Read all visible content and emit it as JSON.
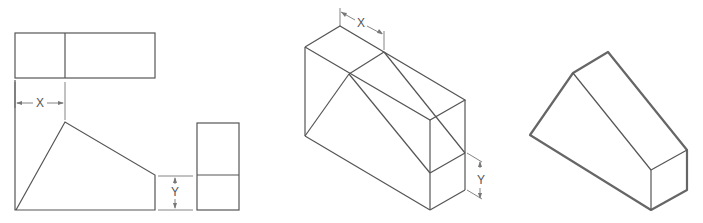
{
  "diagram": {
    "type": "engineering-drawing",
    "views": [
      {
        "id": "orthographic",
        "labels": {
          "x_dimension": "X",
          "y_dimension": "Y"
        }
      },
      {
        "id": "isometric-construction",
        "labels": {
          "x_dimension": "X",
          "y_dimension": "Y"
        }
      },
      {
        "id": "isometric-finished",
        "labels": {}
      }
    ],
    "colors": {
      "line": "#555555",
      "outline": "#666666",
      "background": "#ffffff"
    }
  }
}
